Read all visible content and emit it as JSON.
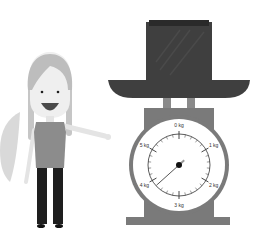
{
  "scene": {
    "description": "Girl pointing at a kitchen scale with a hat on it",
    "colors": {
      "background": "#ffffff",
      "hat": "#3f3f3f",
      "hat_band": "#2a2a2a",
      "scale_body": "#7a7a7a",
      "dial_face": "#ffffff",
      "dial_ring": "#e8e8e8",
      "hair": "#bdbdbd",
      "skin": "#e9e9e9",
      "shirt": "#8c8c8c",
      "pants": "#1e1e1e",
      "leaf": "#d9d9d9"
    }
  },
  "scale": {
    "unit": "kg",
    "labels": [
      "0 kg",
      "1 kg",
      "2 kg",
      "3 kg",
      "4 kg",
      "5 kg"
    ],
    "reading_kg": 3.8
  }
}
